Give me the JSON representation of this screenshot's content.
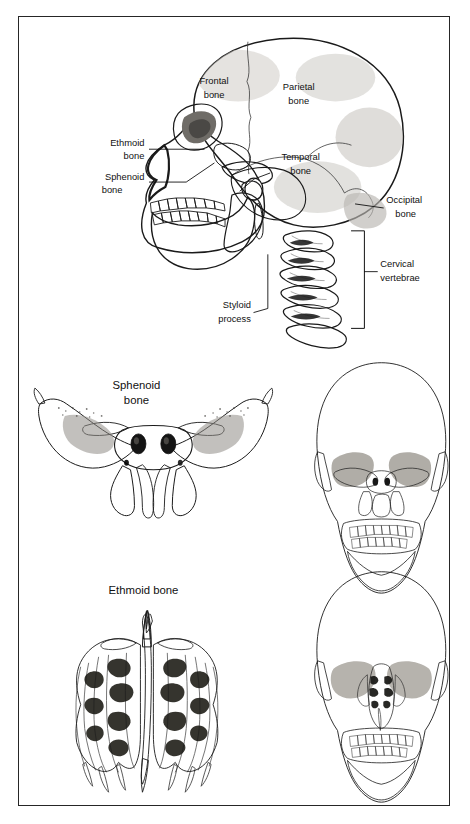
{
  "plate": {
    "title": "Bones of the Skull",
    "border_color": "#262626",
    "background_color": "#ffffff",
    "text_color": "#111111"
  },
  "panels": [
    {
      "id": "lateral-skull",
      "view": "lateral view of skull and cervical spine",
      "labels": [
        {
          "id": "frontal",
          "line1": "Frontal",
          "line2": "bone",
          "x": 196,
          "y": 70,
          "leader": false
        },
        {
          "id": "parietal",
          "line1": "Parietal",
          "line2": "bone",
          "x": 279,
          "y": 78,
          "leader": false
        },
        {
          "id": "temporal",
          "line1": "Temporal",
          "line2": "bone",
          "x": 250,
          "y": 147,
          "leader": true
        },
        {
          "id": "ethmoid",
          "line1": "Ethmoid",
          "line2": "bone",
          "x": 106,
          "y": 132,
          "leader": true
        },
        {
          "id": "sphenoid",
          "line1": "Sphenoid",
          "line2": "bone",
          "x": 102,
          "y": 168,
          "leader": true
        },
        {
          "id": "occipital",
          "line1": "Occipital",
          "line2": "bone",
          "x": 390,
          "y": 191,
          "leader": true
        },
        {
          "id": "cervical",
          "line1": "Cervical",
          "line2": "vertebrae",
          "x": 390,
          "y": 255,
          "leader": true
        },
        {
          "id": "styloid",
          "line1": "Styloid",
          "line2": "process",
          "x": 213,
          "y": 296,
          "leader": true
        }
      ]
    },
    {
      "id": "sphenoid-panel",
      "title": {
        "line1": "Sphenoid",
        "line2": "bone"
      },
      "title_x": 135,
      "title_y": 383,
      "isolated_view": "anterior view of isolated sphenoid bone",
      "context_view": "anterior skull with sphenoid bone highlighted"
    },
    {
      "id": "ethmoid-panel",
      "title": {
        "line1": "Ethmoid bone",
        "line2": ""
      },
      "title_x": 143,
      "title_y": 589,
      "isolated_view": "posterior view of isolated ethmoid bone",
      "context_view": "anterior skull with ethmoid bone highlighted"
    }
  ],
  "palette": {
    "bone_light": "#f2f1ee",
    "bone_mid": "#d9d7d2",
    "bone_dark": "#b4b1ab",
    "bone_deep": "#8e8b86",
    "shadow": "#6a6763",
    "cavity": "#1b1b1b",
    "outline": "#1a1a1a",
    "suture": "#3a3a3a",
    "ghost": "#fbfbfa",
    "ghost_shade": "#e6e4e0"
  }
}
